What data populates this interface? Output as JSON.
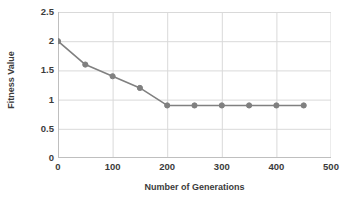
{
  "chart_data": {
    "type": "line",
    "title": "",
    "xlabel": "Number of Generations",
    "ylabel": "Fitness Value",
    "x": [
      0,
      50,
      100,
      150,
      200,
      250,
      300,
      350,
      400,
      450
    ],
    "values": [
      2.0,
      1.6,
      1.4,
      1.2,
      0.9,
      0.9,
      0.9,
      0.9,
      0.9,
      0.9
    ],
    "series": [
      {
        "name": "Fitness Value",
        "values": [
          2.0,
          1.6,
          1.4,
          1.2,
          0.9,
          0.9,
          0.9,
          0.9,
          0.9,
          0.9
        ]
      }
    ],
    "xlim": [
      0,
      500
    ],
    "ylim": [
      0,
      2.5
    ],
    "xticks": [
      0,
      100,
      200,
      300,
      400,
      500
    ],
    "yticks": [
      0,
      0.5,
      1,
      1.5,
      2,
      2.5
    ],
    "xtick_labels": [
      "0",
      "100",
      "200",
      "300",
      "400",
      "500"
    ],
    "ytick_labels": [
      "0",
      "0.5",
      "1",
      "1.5",
      "2",
      "2.5"
    ],
    "grid": true,
    "grid_x": true,
    "grid_y": true,
    "legend": false,
    "legend_position": "none",
    "marker": "circle",
    "series_color": "#808080",
    "grid_color": "#d9d9d9",
    "axis_color": "#bfbfbf",
    "text_color": "#3b3b3b",
    "background": "#ffffff"
  }
}
